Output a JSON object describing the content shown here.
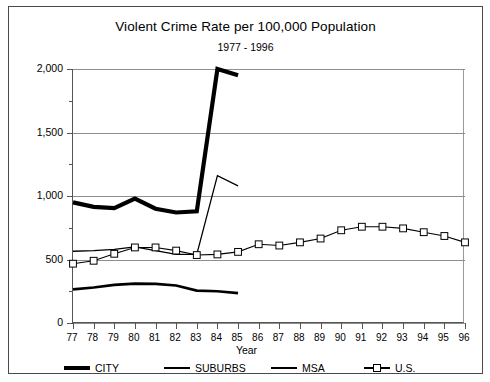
{
  "chart_data": {
    "type": "line",
    "title": "Violent Crime Rate per 100,000 Population",
    "subtitle": "1977 - 1996",
    "xlabel": "Year",
    "ylabel": "",
    "grid": true,
    "legend_position": "bottom",
    "xlim": [
      77,
      96
    ],
    "ylim": [
      0,
      2000
    ],
    "ytick_labels": [
      "0",
      "500",
      "1,000",
      "1,500",
      "2,000"
    ],
    "ytick_values": [
      0,
      500,
      1000,
      1500,
      2000
    ],
    "yminor_values": [
      250,
      750,
      1250,
      1750
    ],
    "categories": [
      "77",
      "78",
      "79",
      "80",
      "81",
      "82",
      "83",
      "84",
      "85",
      "86",
      "87",
      "88",
      "89",
      "90",
      "91",
      "92",
      "93",
      "94",
      "95",
      "96"
    ],
    "series": [
      {
        "name": "CITY",
        "x": [
          77,
          78,
          79,
          80,
          81,
          82,
          83,
          84,
          85
        ],
        "values": [
          950,
          915,
          905,
          980,
          900,
          870,
          880,
          2000,
          1950
        ]
      },
      {
        "name": "SUBURBS",
        "x": [
          77,
          78,
          79,
          80,
          81,
          82,
          83,
          84,
          85
        ],
        "values": [
          265,
          280,
          300,
          310,
          308,
          295,
          255,
          250,
          235
        ]
      },
      {
        "name": "MSA",
        "x": [
          77,
          78,
          79,
          80,
          81,
          82,
          83,
          84,
          85
        ],
        "values": [
          565,
          570,
          580,
          600,
          570,
          540,
          540,
          1160,
          1080
        ]
      },
      {
        "name": "U.S.",
        "x": [
          77,
          78,
          79,
          80,
          81,
          82,
          83,
          84,
          85,
          86,
          87,
          88,
          89,
          90,
          91,
          92,
          93,
          94,
          95,
          96
        ],
        "values": [
          467,
          490,
          545,
          595,
          595,
          570,
          535,
          540,
          560,
          620,
          610,
          635,
          665,
          730,
          758,
          758,
          745,
          715,
          685,
          635
        ]
      }
    ]
  },
  "legend": {
    "items": [
      {
        "label": "CITY",
        "style": "thick-line"
      },
      {
        "label": "SUBURBS",
        "style": "medium-line"
      },
      {
        "label": "MSA",
        "style": "thin-line"
      },
      {
        "label": "U.S.",
        "style": "thin-line-square-marker"
      }
    ]
  }
}
